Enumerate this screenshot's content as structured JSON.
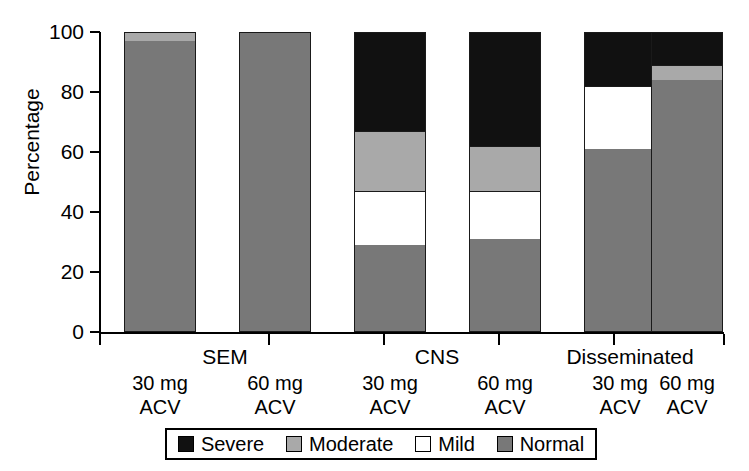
{
  "chart_data": {
    "type": "bar",
    "subtype": "stacked-bar-100",
    "title": "",
    "xlabel": "",
    "ylabel": "Percentage",
    "ylim": [
      0,
      100
    ],
    "yticks": [
      0,
      20,
      40,
      60,
      80,
      100
    ],
    "ytick_labels": [
      "0",
      "20",
      "40",
      "60",
      "80",
      "100"
    ],
    "grid": false,
    "legend_position": "bottom",
    "groups": [
      {
        "name": "SEM",
        "label": "SEM"
      },
      {
        "name": "CNS",
        "label": "CNS"
      },
      {
        "name": "Disseminated",
        "label": "Disseminated"
      }
    ],
    "categories": [
      "SEM 30 mg ACV",
      "SEM 60 mg ACV",
      "CNS 30 mg ACV",
      "CNS 60 mg ACV",
      "Disseminated 30 mg ACV",
      "Disseminated 60 mg ACV"
    ],
    "tick_labels": [
      {
        "line1": "30 mg",
        "line2": "ACV"
      },
      {
        "line1": "60 mg",
        "line2": "ACV"
      },
      {
        "line1": "30 mg",
        "line2": "ACV"
      },
      {
        "line1": "60 mg",
        "line2": "ACV"
      },
      {
        "line1": "30 mg",
        "line2": "ACV"
      },
      {
        "line1": "60 mg",
        "line2": "ACV"
      }
    ],
    "series": [
      {
        "name": "Normal",
        "color": "#787878",
        "values": [
          97,
          100,
          29,
          31,
          61,
          84
        ]
      },
      {
        "name": "Mild",
        "color": "#ffffff",
        "values": [
          0,
          0,
          18,
          16,
          21,
          0
        ]
      },
      {
        "name": "Moderate",
        "color": "#a9a9a9",
        "values": [
          3,
          0,
          20,
          15,
          0,
          5
        ]
      },
      {
        "name": "Severe",
        "color": "#111111",
        "values": [
          0,
          0,
          33,
          38,
          18,
          11
        ]
      }
    ],
    "stack_order_bottom_to_top": [
      "Normal",
      "Mild",
      "Moderate",
      "Severe"
    ]
  },
  "legend": {
    "items": [
      {
        "label": "Severe",
        "color": "#111111"
      },
      {
        "label": "Moderate",
        "color": "#a9a9a9"
      },
      {
        "label": "Mild",
        "color": "#ffffff"
      },
      {
        "label": "Normal",
        "color": "#787878"
      }
    ]
  }
}
